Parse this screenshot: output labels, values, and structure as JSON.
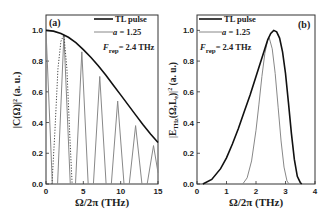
{
  "chart_data": [
    {
      "type": "line",
      "panel_label": "(a)",
      "xlabel": "Ω/2π (THz)",
      "ylabel": "|C(Ω)|² (a. u.)",
      "xlim": [
        0,
        15
      ],
      "ylim": [
        0,
        1.1
      ],
      "xticks": [
        0,
        5,
        10,
        15
      ],
      "yticks": [
        0.0,
        0.2,
        0.4,
        0.6,
        0.8,
        1.0
      ],
      "ytick_labels": [
        "0.0",
        "0.2",
        "0.4",
        "0.6",
        "0.8",
        "1.0"
      ],
      "grid": false,
      "legend": {
        "position": "upper right",
        "entries": [
          "TL pulse",
          "a = 1.25"
        ],
        "annotation": "F_rep = 2.4 THz"
      },
      "series": [
        {
          "name": "TL pulse",
          "color": "#111111",
          "style": "solid",
          "x": [
            0,
            1,
            2,
            3,
            4,
            5,
            6,
            7,
            8,
            9,
            10,
            11,
            12,
            13,
            14,
            15
          ],
          "y": [
            1.0,
            0.995,
            0.98,
            0.955,
            0.92,
            0.875,
            0.825,
            0.77,
            0.71,
            0.645,
            0.58,
            0.515,
            0.45,
            0.385,
            0.325,
            0.27
          ]
        },
        {
          "name": "a = 1.25",
          "color": "#888888",
          "style": "solid",
          "kind": "comb",
          "peak_x": [
            0,
            2.4,
            4.8,
            7.2,
            9.6,
            12.0,
            14.4
          ],
          "peak_y": [
            1.0,
            0.97,
            0.86,
            0.7,
            0.54,
            0.38,
            0.25
          ],
          "half_width": 0.85
        },
        {
          "name": "envelope (dotted)",
          "color": "#444444",
          "style": "dotted",
          "x": [
            0.8,
            1.2,
            1.6,
            2.0,
            2.4,
            2.8,
            3.2,
            3.5
          ],
          "y": [
            0.0,
            0.35,
            0.75,
            0.93,
            0.97,
            0.75,
            0.3,
            0.0
          ]
        }
      ]
    },
    {
      "type": "line",
      "panel_label": "(b)",
      "xlabel": "Ω/2π (THz)",
      "ylabel": "|E_THz(Ω,L_e)|² (a. u.)",
      "xlim": [
        0,
        4
      ],
      "ylim": [
        0,
        1.1
      ],
      "xticks": [
        0,
        1,
        2,
        3,
        4
      ],
      "yticks": [
        0.0,
        0.2,
        0.4,
        0.6,
        0.8,
        1.0
      ],
      "ytick_labels": [
        "0.0",
        "0.2",
        "0.4",
        "0.6",
        "0.8",
        "1.0"
      ],
      "grid": false,
      "legend": {
        "position": "upper left",
        "entries": [
          "TL pulse",
          "a = 1.25"
        ],
        "annotation": "F_rep = 2.4 THz"
      },
      "series": [
        {
          "name": "TL pulse",
          "color": "#111111",
          "style": "solid",
          "x": [
            0.2,
            0.5,
            0.8,
            1.0,
            1.2,
            1.4,
            1.6,
            1.8,
            2.0,
            2.2,
            2.4,
            2.5,
            2.6,
            2.7,
            2.8,
            2.9,
            3.0,
            3.1,
            3.2,
            3.3,
            3.4,
            3.5,
            3.55
          ],
          "y": [
            0.0,
            0.03,
            0.1,
            0.17,
            0.26,
            0.36,
            0.47,
            0.58,
            0.7,
            0.82,
            0.94,
            0.98,
            1.0,
            0.99,
            0.95,
            0.86,
            0.72,
            0.53,
            0.33,
            0.16,
            0.05,
            0.01,
            0.0
          ]
        },
        {
          "name": "a = 1.25",
          "color": "#888888",
          "style": "solid",
          "x": [
            1.55,
            1.7,
            1.85,
            2.0,
            2.1,
            2.2,
            2.3,
            2.4,
            2.45,
            2.55,
            2.65,
            2.75,
            2.85,
            2.95,
            3.05,
            3.12
          ],
          "y": [
            0.0,
            0.04,
            0.15,
            0.35,
            0.52,
            0.7,
            0.85,
            0.94,
            0.95,
            0.88,
            0.72,
            0.5,
            0.28,
            0.11,
            0.02,
            0.0
          ]
        }
      ]
    }
  ]
}
